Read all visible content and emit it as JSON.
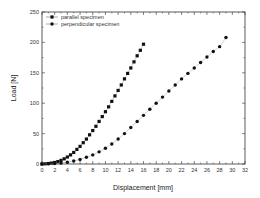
{
  "chart_data": {
    "type": "scatter",
    "title": "",
    "xlabel": "Displacement [mm]",
    "ylabel": "Load [N]",
    "xlim": [
      0,
      32
    ],
    "ylim": [
      0,
      250
    ],
    "xticks": [
      0,
      2,
      4,
      6,
      8,
      10,
      12,
      14,
      16,
      18,
      20,
      22,
      24,
      26,
      28,
      30,
      32
    ],
    "yticks": [
      0,
      50,
      100,
      150,
      200,
      250
    ],
    "grid": false,
    "legend_position": "upper-left",
    "series": [
      {
        "name": "parallel specimen",
        "marker": "square",
        "color": "#111111",
        "x": [
          0,
          0.5,
          1,
          1.5,
          2,
          2.5,
          3,
          3.5,
          4,
          4.5,
          5,
          5.5,
          6,
          6.5,
          7,
          7.5,
          8,
          8.5,
          9,
          9.5,
          10,
          10.5,
          11,
          11.5,
          12,
          12.5,
          13,
          13.5,
          14,
          14.5,
          15,
          15.5,
          16
        ],
        "y": [
          0,
          0.3,
          0.8,
          1.5,
          2.5,
          4,
          6,
          8.5,
          11.5,
          15,
          19,
          24,
          29,
          35,
          41,
          48,
          55,
          62,
          70,
          78,
          86,
          94,
          103,
          112,
          121,
          130,
          140,
          149,
          158,
          168,
          178,
          187,
          197
        ]
      },
      {
        "name": "perpendicular specimen",
        "marker": "circle",
        "color": "#111111",
        "x": [
          0,
          1,
          2,
          3,
          4,
          5,
          6,
          7,
          8,
          9,
          10,
          11,
          12,
          13,
          14,
          15,
          16,
          17,
          18,
          19,
          20,
          21,
          22,
          23,
          24,
          25,
          26,
          27,
          28,
          29
        ],
        "y": [
          0,
          0.3,
          0.8,
          1.6,
          3,
          5,
          7.5,
          11,
          15,
          20,
          26,
          33,
          41,
          50,
          60,
          70,
          80,
          90,
          100,
          110,
          120,
          130,
          140,
          149,
          158,
          167,
          176,
          185,
          193,
          208
        ]
      }
    ]
  }
}
